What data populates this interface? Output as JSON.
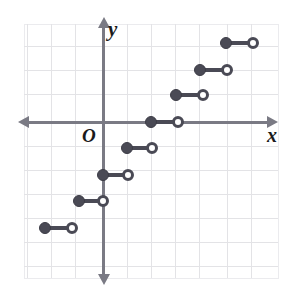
{
  "figure": {
    "kind": "coordinate-plane",
    "origin_label": "O",
    "x_axis_label": "x",
    "y_axis_label": "y"
  },
  "chart_data": {
    "type": "line",
    "title": "",
    "subtitle": "",
    "xlabel": "x",
    "ylabel": "y",
    "origin_label": "O",
    "grid": true,
    "legend": "none",
    "grid_step": 1,
    "xlim": [
      -3.3,
      7.3
    ],
    "ylim": [
      -6.5,
      4.1
    ],
    "series": [
      {
        "name": "step-function",
        "style": "step-segments",
        "closed_endpoint": "left",
        "open_endpoint": "right",
        "segments": [
          {
            "index": 0,
            "x_start": -2.4,
            "x_end": -1.3,
            "y": -4.4,
            "left_dot": "closed",
            "right_dot": "open"
          },
          {
            "index": 1,
            "x_start": -1.0,
            "x_end": 0.0,
            "y": -3.3,
            "left_dot": "closed",
            "right_dot": "open"
          },
          {
            "index": 2,
            "x_start": 0.0,
            "x_end": 1.0,
            "y": -2.2,
            "left_dot": "closed",
            "right_dot": "open"
          },
          {
            "index": 3,
            "x_start": 1.0,
            "x_end": 2.0,
            "y": -1.1,
            "left_dot": "closed",
            "right_dot": "open"
          },
          {
            "index": 4,
            "x_start": 2.0,
            "x_end": 3.1,
            "y": 0.0,
            "left_dot": "closed",
            "right_dot": "open"
          },
          {
            "index": 5,
            "x_start": 3.1,
            "x_end": 4.1,
            "y": 1.2,
            "left_dot": "closed",
            "right_dot": "open"
          },
          {
            "index": 6,
            "x_start": 4.1,
            "x_end": 5.2,
            "y": 2.2,
            "left_dot": "closed",
            "right_dot": "open"
          },
          {
            "index": 7,
            "x_start": 5.2,
            "x_end": 6.2,
            "y": 3.3,
            "left_dot": "closed",
            "right_dot": "open"
          }
        ]
      }
    ]
  },
  "colors": {
    "grid": "#e3e3e6",
    "axis": "#7a7a84",
    "curve": "#4a4a55",
    "label": "#1b1b1b",
    "background": "#ffffff"
  },
  "pixel_layout": {
    "origin_px": {
      "x": 103,
      "y": 122
    },
    "unit_px": 24,
    "plot_rect": {
      "left": 24,
      "top": 24,
      "width": 255,
      "height": 255
    },
    "vlines_px": [
      27,
      51,
      75,
      103,
      127,
      151,
      175,
      199,
      227,
      251,
      275
    ],
    "hlines_px": [
      46,
      70,
      94,
      122,
      146,
      170,
      194,
      218,
      242,
      266
    ],
    "segments_px": [
      {
        "x1": 45,
        "x2": 72,
        "y": 228
      },
      {
        "x1": 79,
        "x2": 103,
        "y": 201
      },
      {
        "x1": 103,
        "x2": 128,
        "y": 175
      },
      {
        "x1": 127,
        "x2": 152,
        "y": 148
      },
      {
        "x1": 151,
        "x2": 178,
        "y": 122
      },
      {
        "x1": 176,
        "x2": 203,
        "y": 95
      },
      {
        "x1": 200,
        "x2": 227,
        "y": 70
      },
      {
        "x1": 226,
        "x2": 253,
        "y": 43
      }
    ]
  }
}
